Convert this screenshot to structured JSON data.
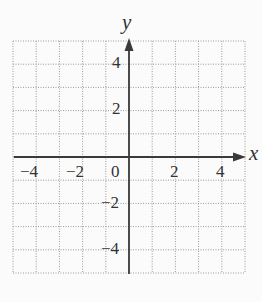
{
  "chart_data": {
    "type": "scatter",
    "title": "",
    "xlabel": "x",
    "ylabel": "y",
    "xlim": [
      -5,
      5
    ],
    "ylim": [
      -5,
      5
    ],
    "grid": true,
    "grid_step": 1,
    "grid_style": "dotted",
    "x_ticks": [
      -4,
      -2,
      0,
      2,
      4
    ],
    "y_ticks": [
      4,
      2,
      -2,
      -4
    ],
    "x_tick_labels": [
      "−4",
      "−2",
      "0",
      "2",
      "4"
    ],
    "y_tick_labels": [
      "4",
      "2",
      "−2",
      "−4"
    ],
    "series": [],
    "legend": null
  },
  "labels": {
    "x_axis": "x",
    "y_axis": "y",
    "x_ticks": [
      "−4",
      "−2",
      "0",
      "2",
      "4"
    ],
    "y_ticks": [
      "4",
      "2",
      "−2",
      "−4"
    ]
  },
  "colors": {
    "axis": "#3a3a3a",
    "grid": "#9a9a9a",
    "text": "#333333",
    "background": "#fbfbfb"
  }
}
